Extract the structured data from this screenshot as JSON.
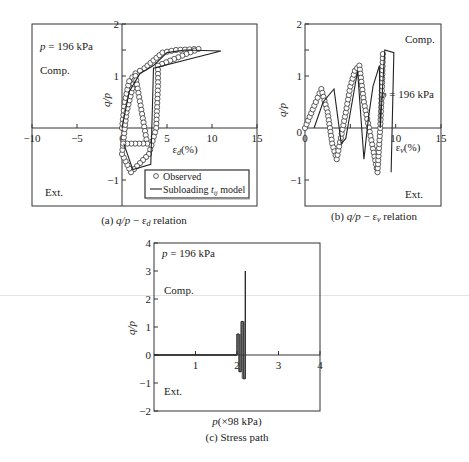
{
  "chart_data": [
    {
      "id": "a",
      "type": "scatter",
      "caption": "(a) q/p − εd relation",
      "caption_parts": {
        "prefix": "(a) ",
        "var": "q/p",
        "dash": " − ε",
        "sub": "d",
        "suffix": " relation"
      },
      "xlabel": "εd(%)",
      "xlabel_parts": {
        "eps": "ε",
        "sub": "d",
        "unit": "(%)"
      },
      "ylabel": "q/p",
      "xlim": [
        -10,
        15
      ],
      "ylim": [
        -1.5,
        2
      ],
      "xticks": [
        -10,
        -5,
        0,
        5,
        10,
        15
      ],
      "yticks": [
        -1,
        1,
        2
      ],
      "annotations": [
        "p = 196 kPa",
        "Comp.",
        "Ext."
      ],
      "legend": {
        "position": "lower right",
        "entries": [
          "Observed",
          "Subloading tij model"
        ]
      },
      "series": [
        {
          "name": "Observed",
          "style": "open-circle markers",
          "points": [
            [
              0,
              0
            ],
            [
              0.3,
              0.5
            ],
            [
              0.8,
              0.9
            ],
            [
              1.5,
              1.05
            ],
            [
              2.5,
              1.15
            ],
            [
              3.5,
              1.3
            ],
            [
              4.5,
              1.45
            ],
            [
              6,
              1.5
            ],
            [
              8.5,
              1.52
            ],
            [
              4,
              1.2
            ],
            [
              4,
              0.8
            ],
            [
              3.8,
              0
            ],
            [
              3,
              -0.5
            ],
            [
              1,
              -0.85
            ],
            [
              0,
              -0.5
            ],
            [
              0.5,
              0.3
            ],
            [
              1.5,
              1.0
            ],
            [
              2.8,
              -0.3
            ],
            [
              -0.3,
              -0.3
            ]
          ]
        },
        {
          "name": "Subloading tij model",
          "style": "solid line",
          "points": [
            [
              0,
              0
            ],
            [
              0.8,
              0.7
            ],
            [
              2,
              1.05
            ],
            [
              3.5,
              1.2
            ],
            [
              5,
              1.45
            ],
            [
              7,
              1.5
            ],
            [
              11,
              1.48
            ],
            [
              3.5,
              1.15
            ],
            [
              3.2,
              -0.7
            ],
            [
              1.2,
              -0.8
            ],
            [
              0.2,
              -0.3
            ]
          ]
        }
      ]
    },
    {
      "id": "b",
      "type": "scatter",
      "caption": "(b) q/p − εv relation",
      "caption_parts": {
        "prefix": "(b) ",
        "var": "q/p",
        "dash": " − ε",
        "sub": "v",
        "suffix": " relation"
      },
      "xlabel": "εv(%)",
      "xlabel_parts": {
        "eps": "ε",
        "sub": "v",
        "unit": "(%)"
      },
      "ylabel": "q/p",
      "xlim": [
        0,
        15
      ],
      "ylim": [
        -1.5,
        2
      ],
      "xticks": [
        0,
        10,
        15
      ],
      "yticks": [
        -1,
        1,
        2
      ],
      "annotations": [
        "Comp.",
        "p = 196 kPa",
        "Ext."
      ],
      "series": [
        {
          "name": "Observed",
          "style": "open-circle markers",
          "points": [
            [
              0,
              0
            ],
            [
              1.2,
              0.5
            ],
            [
              1.8,
              0.75
            ],
            [
              2.5,
              0.3
            ],
            [
              3,
              -0.3
            ],
            [
              3.5,
              -0.6
            ],
            [
              4.5,
              0.3
            ],
            [
              5,
              0.8
            ],
            [
              5.5,
              1.1
            ],
            [
              6,
              1.2
            ],
            [
              6.5,
              0.5
            ],
            [
              7.5,
              -0.4
            ],
            [
              8,
              -0.85
            ],
            [
              8.3,
              0
            ],
            [
              8.5,
              0.8
            ],
            [
              8.6,
              1.5
            ]
          ]
        },
        {
          "name": "Subloading tij model",
          "style": "solid line",
          "points": [
            [
              1,
              0
            ],
            [
              2,
              0.5
            ],
            [
              3.2,
              0.75
            ],
            [
              4,
              -0.3
            ],
            [
              4.5,
              -0.2
            ],
            [
              5.2,
              0.5
            ],
            [
              5.8,
              1.1
            ],
            [
              6.5,
              -0.6
            ],
            [
              7,
              0.2
            ],
            [
              7.5,
              0.8
            ],
            [
              8.2,
              1.2
            ],
            [
              8.3,
              0
            ],
            [
              8.8,
              1.5
            ],
            [
              9.8,
              1.45
            ],
            [
              9.5,
              -0.85
            ]
          ]
        }
      ]
    },
    {
      "id": "c",
      "type": "line",
      "caption": "(c) Stress path",
      "xlabel": "p(×98 kPa)",
      "ylabel": "q/p",
      "xlim": [
        0,
        4
      ],
      "ylim": [
        -2,
        4
      ],
      "xticks": [
        1,
        2,
        3,
        4
      ],
      "yticks": [
        -2,
        -1,
        0,
        1,
        2,
        3,
        4
      ],
      "annotations": [
        "p = 196 kPa",
        "Comp.",
        "Ext."
      ],
      "series": [
        {
          "name": "Stress path",
          "style": "solid line",
          "segments": [
            {
              "x": [
                0,
                2.0
              ],
              "y": [
                0,
                0
              ]
            },
            {
              "x": 2.0,
              "y": [
                0,
                0.75
              ]
            },
            {
              "x": 2.05,
              "y": [
                0.75,
                -0.6
              ]
            },
            {
              "x": 2.1,
              "y": [
                -0.6,
                1.2
              ]
            },
            {
              "x": 2.15,
              "y": [
                1.2,
                -0.85
              ]
            },
            {
              "x": 2.2,
              "y": [
                -0.85,
                3.0
              ]
            }
          ]
        }
      ]
    }
  ]
}
